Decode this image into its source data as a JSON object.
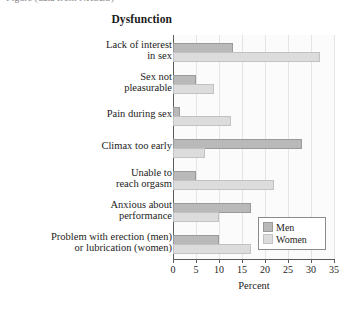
{
  "caption": {
    "clipped_line": "Figure (data from NHSLS)"
  },
  "chart_data": {
    "type": "bar",
    "orientation": "horizontal",
    "title": "",
    "ylabel": "Dysfunction",
    "xlabel": "Percent",
    "xlim": [
      0,
      35
    ],
    "xticks": [
      0,
      5,
      10,
      15,
      20,
      25,
      30,
      35
    ],
    "xtick_labels": [
      "0",
      "5",
      "10",
      "15",
      "20",
      "25",
      "30",
      "35"
    ],
    "grid": true,
    "legend_position": "lower right",
    "categories": [
      "Lack of interest in sex",
      "Sex not pleasurable",
      "Pain during sex",
      "Climax too early",
      "Unable to reach orgasm",
      "Anxious about performance",
      "Problem with erection (men) or lubrication (women)"
    ],
    "category_lines": [
      [
        "Lack of interest",
        "in sex"
      ],
      [
        "Sex not",
        "pleasurable"
      ],
      [
        "Pain during sex"
      ],
      [
        "Climax too early"
      ],
      [
        "Unable to",
        "reach orgasm"
      ],
      [
        "Anxious about",
        "performance"
      ],
      [
        "Problem with erection (men)",
        "or lubrication (women)"
      ]
    ],
    "series": [
      {
        "name": "Men",
        "color": "#b9b9b9",
        "values": [
          13,
          5,
          1.5,
          28,
          5,
          17,
          10
        ]
      },
      {
        "name": "Women",
        "color": "#dcdcdc",
        "values": [
          32,
          9,
          12.5,
          7,
          22,
          10,
          17
        ]
      }
    ]
  },
  "legend": {
    "entries": [
      {
        "label": "Men"
      },
      {
        "label": "Women"
      }
    ]
  }
}
